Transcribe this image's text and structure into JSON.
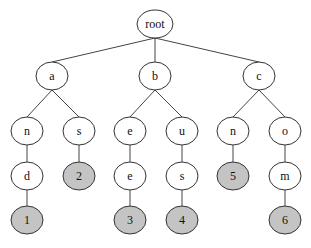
{
  "diagram": {
    "type": "trie",
    "colors": {
      "node_fill": "#ffffff",
      "terminal_fill": "#c4c4c4",
      "stroke": "#333333",
      "edge": "#444444"
    },
    "nodes": [
      {
        "id": "root",
        "label": "root",
        "x": 155,
        "y": 24,
        "terminal": false
      },
      {
        "id": "a",
        "label": "a",
        "x": 52,
        "y": 76,
        "terminal": false
      },
      {
        "id": "b",
        "label": "b",
        "x": 155,
        "y": 76,
        "terminal": false
      },
      {
        "id": "c",
        "label": "c",
        "x": 259,
        "y": 76,
        "terminal": false
      },
      {
        "id": "an",
        "label": "n",
        "x": 27,
        "y": 131,
        "terminal": false
      },
      {
        "id": "as",
        "label": "s",
        "x": 79,
        "y": 131,
        "terminal": false
      },
      {
        "id": "be",
        "label": "e",
        "x": 130,
        "y": 131,
        "terminal": false
      },
      {
        "id": "bu",
        "label": "u",
        "x": 182,
        "y": 131,
        "terminal": false
      },
      {
        "id": "cn",
        "label": "n",
        "x": 233,
        "y": 131,
        "terminal": false
      },
      {
        "id": "co",
        "label": "o",
        "x": 285,
        "y": 131,
        "terminal": false
      },
      {
        "id": "and",
        "label": "d",
        "x": 27,
        "y": 176,
        "terminal": false
      },
      {
        "id": "as2",
        "label": "2",
        "x": 79,
        "y": 176,
        "terminal": true
      },
      {
        "id": "bee",
        "label": "e",
        "x": 130,
        "y": 176,
        "terminal": false
      },
      {
        "id": "bus",
        "label": "s",
        "x": 182,
        "y": 176,
        "terminal": false
      },
      {
        "id": "cn5",
        "label": "5",
        "x": 233,
        "y": 176,
        "terminal": true
      },
      {
        "id": "com",
        "label": "m",
        "x": 285,
        "y": 176,
        "terminal": false
      },
      {
        "id": "and1",
        "label": "1",
        "x": 27,
        "y": 220,
        "terminal": true
      },
      {
        "id": "bee3",
        "label": "3",
        "x": 130,
        "y": 220,
        "terminal": true
      },
      {
        "id": "bus4",
        "label": "4",
        "x": 182,
        "y": 220,
        "terminal": true
      },
      {
        "id": "com6",
        "label": "6",
        "x": 285,
        "y": 220,
        "terminal": true
      }
    ],
    "edges": [
      [
        "root",
        "a"
      ],
      [
        "root",
        "b"
      ],
      [
        "root",
        "c"
      ],
      [
        "a",
        "an"
      ],
      [
        "a",
        "as"
      ],
      [
        "b",
        "be"
      ],
      [
        "b",
        "bu"
      ],
      [
        "c",
        "cn"
      ],
      [
        "c",
        "co"
      ],
      [
        "an",
        "and"
      ],
      [
        "as",
        "as2"
      ],
      [
        "be",
        "bee"
      ],
      [
        "bu",
        "bus"
      ],
      [
        "cn",
        "cn5"
      ],
      [
        "co",
        "com"
      ],
      [
        "and",
        "and1"
      ],
      [
        "bee",
        "bee3"
      ],
      [
        "bus",
        "bus4"
      ],
      [
        "com",
        "com6"
      ]
    ]
  }
}
